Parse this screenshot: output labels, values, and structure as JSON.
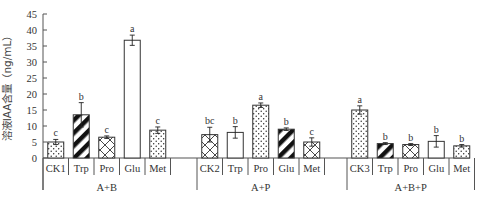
{
  "chart_data": {
    "type": "bar",
    "title": "",
    "xlabel": "",
    "ylabel": "溶液IAA含量（ng/mL）",
    "ylim": [
      0,
      45
    ],
    "yticks": [
      0,
      5,
      10,
      15,
      20,
      25,
      30,
      35,
      40,
      45
    ],
    "grid": false,
    "legend": null,
    "groups": [
      {
        "name": "A+B",
        "bars": [
          {
            "label": "CK1",
            "value": 5.0,
            "error": 0.8,
            "sig": "c",
            "pattern": "dots"
          },
          {
            "label": "Trp",
            "value": 13.5,
            "error": 3.8,
            "sig": "b",
            "pattern": "diagonal"
          },
          {
            "label": "Pro",
            "value": 6.5,
            "error": 0.4,
            "sig": "c",
            "pattern": "crosshatch"
          },
          {
            "label": "Glu",
            "value": 36.8,
            "error": 1.6,
            "sig": "a",
            "pattern": "none"
          },
          {
            "label": "Met",
            "value": 8.7,
            "error": 1.0,
            "sig": "c",
            "pattern": "dots"
          }
        ]
      },
      {
        "name": "A+P",
        "bars": [
          {
            "label": "CK2",
            "value": 7.3,
            "error": 2.3,
            "sig": "bc",
            "pattern": "crosshatch"
          },
          {
            "label": "Trp",
            "value": 8.0,
            "error": 1.8,
            "sig": "b",
            "pattern": "none"
          },
          {
            "label": "Pro",
            "value": 16.5,
            "error": 0.7,
            "sig": "a",
            "pattern": "dots"
          },
          {
            "label": "Glu",
            "value": 9.0,
            "error": 0.4,
            "sig": "b",
            "pattern": "diagonal"
          },
          {
            "label": "Met",
            "value": 5.0,
            "error": 1.3,
            "sig": "c",
            "pattern": "crosshatch"
          }
        ]
      },
      {
        "name": "A+B+P",
        "bars": [
          {
            "label": "CK3",
            "value": 15.0,
            "error": 1.3,
            "sig": "a",
            "pattern": "dots"
          },
          {
            "label": "Trp",
            "value": 4.5,
            "error": 0.3,
            "sig": "b",
            "pattern": "diagonal"
          },
          {
            "label": "Pro",
            "value": 4.2,
            "error": 0.3,
            "sig": "b",
            "pattern": "crosshatch"
          },
          {
            "label": "Glu",
            "value": 5.2,
            "error": 1.8,
            "sig": "b",
            "pattern": "none"
          },
          {
            "label": "Met",
            "value": 3.8,
            "error": 0.4,
            "sig": "b",
            "pattern": "dots"
          }
        ]
      }
    ]
  },
  "colors": {
    "axis": "#555555",
    "bar_stroke": "#333333",
    "bar_fill": "#ffffff",
    "pattern": "#111111"
  }
}
